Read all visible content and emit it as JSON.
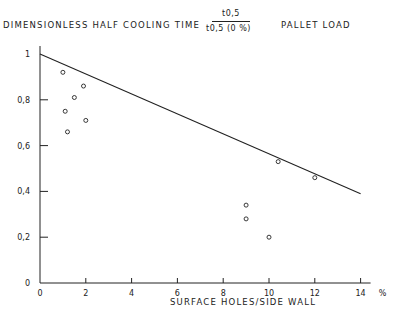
{
  "chart_data": {
    "type": "scatter",
    "title": "DIMENSIONLESS  HALF  COOLING  TIME",
    "title_fraction": {
      "numerator": "t0,5",
      "denominator": "t0,5 (0 %)"
    },
    "subtitle": "PALLET  LOAD",
    "xlabel": "SURFACE   HOLES/SIDE  WALL",
    "x_unit": "%",
    "ylabel": "",
    "xlim": [
      0,
      14
    ],
    "ylim": [
      0,
      1
    ],
    "x_ticks": [
      "0",
      "2",
      "4",
      "6",
      "8",
      "10",
      "12",
      "14"
    ],
    "y_ticks": [
      "0",
      "0,2",
      "0,4",
      "0,6",
      "0,8",
      "1"
    ],
    "grid": false,
    "series": [
      {
        "name": "measured",
        "marker": "open-circle",
        "points": [
          {
            "x": 1.0,
            "y": 0.92
          },
          {
            "x": 1.9,
            "y": 0.86
          },
          {
            "x": 1.5,
            "y": 0.81
          },
          {
            "x": 1.1,
            "y": 0.75
          },
          {
            "x": 2.0,
            "y": 0.71
          },
          {
            "x": 1.2,
            "y": 0.66
          },
          {
            "x": 9.0,
            "y": 0.34
          },
          {
            "x": 9.0,
            "y": 0.28
          },
          {
            "x": 10.0,
            "y": 0.2
          },
          {
            "x": 10.4,
            "y": 0.53
          },
          {
            "x": 12.0,
            "y": 0.46
          }
        ]
      },
      {
        "name": "fit line",
        "marker": "line",
        "points": [
          {
            "x": 0,
            "y": 1.0
          },
          {
            "x": 14,
            "y": 0.39
          }
        ]
      }
    ]
  },
  "labels": {
    "title": "DIMENSIONLESS  HALF  COOLING  TIME",
    "frac_num": "t0,5",
    "frac_den": "t0,5 (0 %)",
    "subtitle": "PALLET  LOAD",
    "xlabel": "SURFACE   HOLES/SIDE  WALL",
    "x_unit": "%"
  }
}
